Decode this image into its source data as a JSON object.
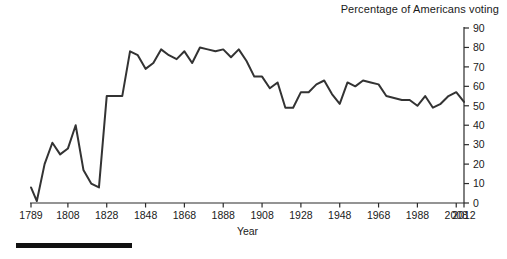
{
  "chart_data": {
    "type": "line",
    "title": "Percentage of Americans voting",
    "xlabel": "Year",
    "ylabel": "",
    "xlim": [
      1789,
      2012
    ],
    "ylim": [
      0,
      90
    ],
    "grid": false,
    "legend": null,
    "y_axis_position": "right",
    "x_ticks": [
      1789,
      1808,
      1828,
      1848,
      1868,
      1888,
      1908,
      1928,
      1948,
      1968,
      1988,
      2008,
      2012
    ],
    "x_tick_labels": [
      "1789",
      "1808",
      "1828",
      "1848",
      "1868",
      "1888",
      "1908",
      "1928",
      "1948",
      "1968",
      "1988",
      "2008",
      "2012"
    ],
    "y_ticks": [
      0,
      10,
      20,
      30,
      40,
      50,
      60,
      70,
      80,
      90
    ],
    "y_tick_labels": [
      "0",
      "10",
      "20",
      "30",
      "40",
      "50",
      "60",
      "70",
      "80",
      "90"
    ],
    "series": [
      {
        "name": "Percentage of Americans voting",
        "color": "#333333",
        "x": [
          1789,
          1792,
          1796,
          1800,
          1804,
          1808,
          1812,
          1816,
          1820,
          1824,
          1828,
          1832,
          1836,
          1840,
          1844,
          1848,
          1852,
          1856,
          1860,
          1864,
          1868,
          1872,
          1876,
          1880,
          1884,
          1888,
          1892,
          1896,
          1900,
          1904,
          1908,
          1912,
          1916,
          1920,
          1924,
          1928,
          1932,
          1936,
          1940,
          1944,
          1948,
          1952,
          1956,
          1960,
          1964,
          1968,
          1972,
          1976,
          1980,
          1984,
          1988,
          1992,
          1996,
          2000,
          2004,
          2008,
          2012
        ],
        "values": [
          8,
          1,
          20,
          31,
          25,
          28,
          40,
          17,
          10,
          8,
          55,
          55,
          55,
          78,
          76,
          69,
          72,
          79,
          76,
          74,
          78,
          72,
          80,
          79,
          78,
          79,
          75,
          79,
          73,
          65,
          65,
          59,
          62,
          49,
          49,
          57,
          57,
          61,
          63,
          56,
          51,
          62,
          60,
          63,
          62,
          61,
          55,
          54,
          53,
          53,
          50,
          55,
          49,
          51,
          55,
          57,
          52
        ]
      }
    ],
    "annotations": []
  },
  "figure": {
    "scale_bar": {
      "present": true,
      "color": "#111111"
    }
  }
}
